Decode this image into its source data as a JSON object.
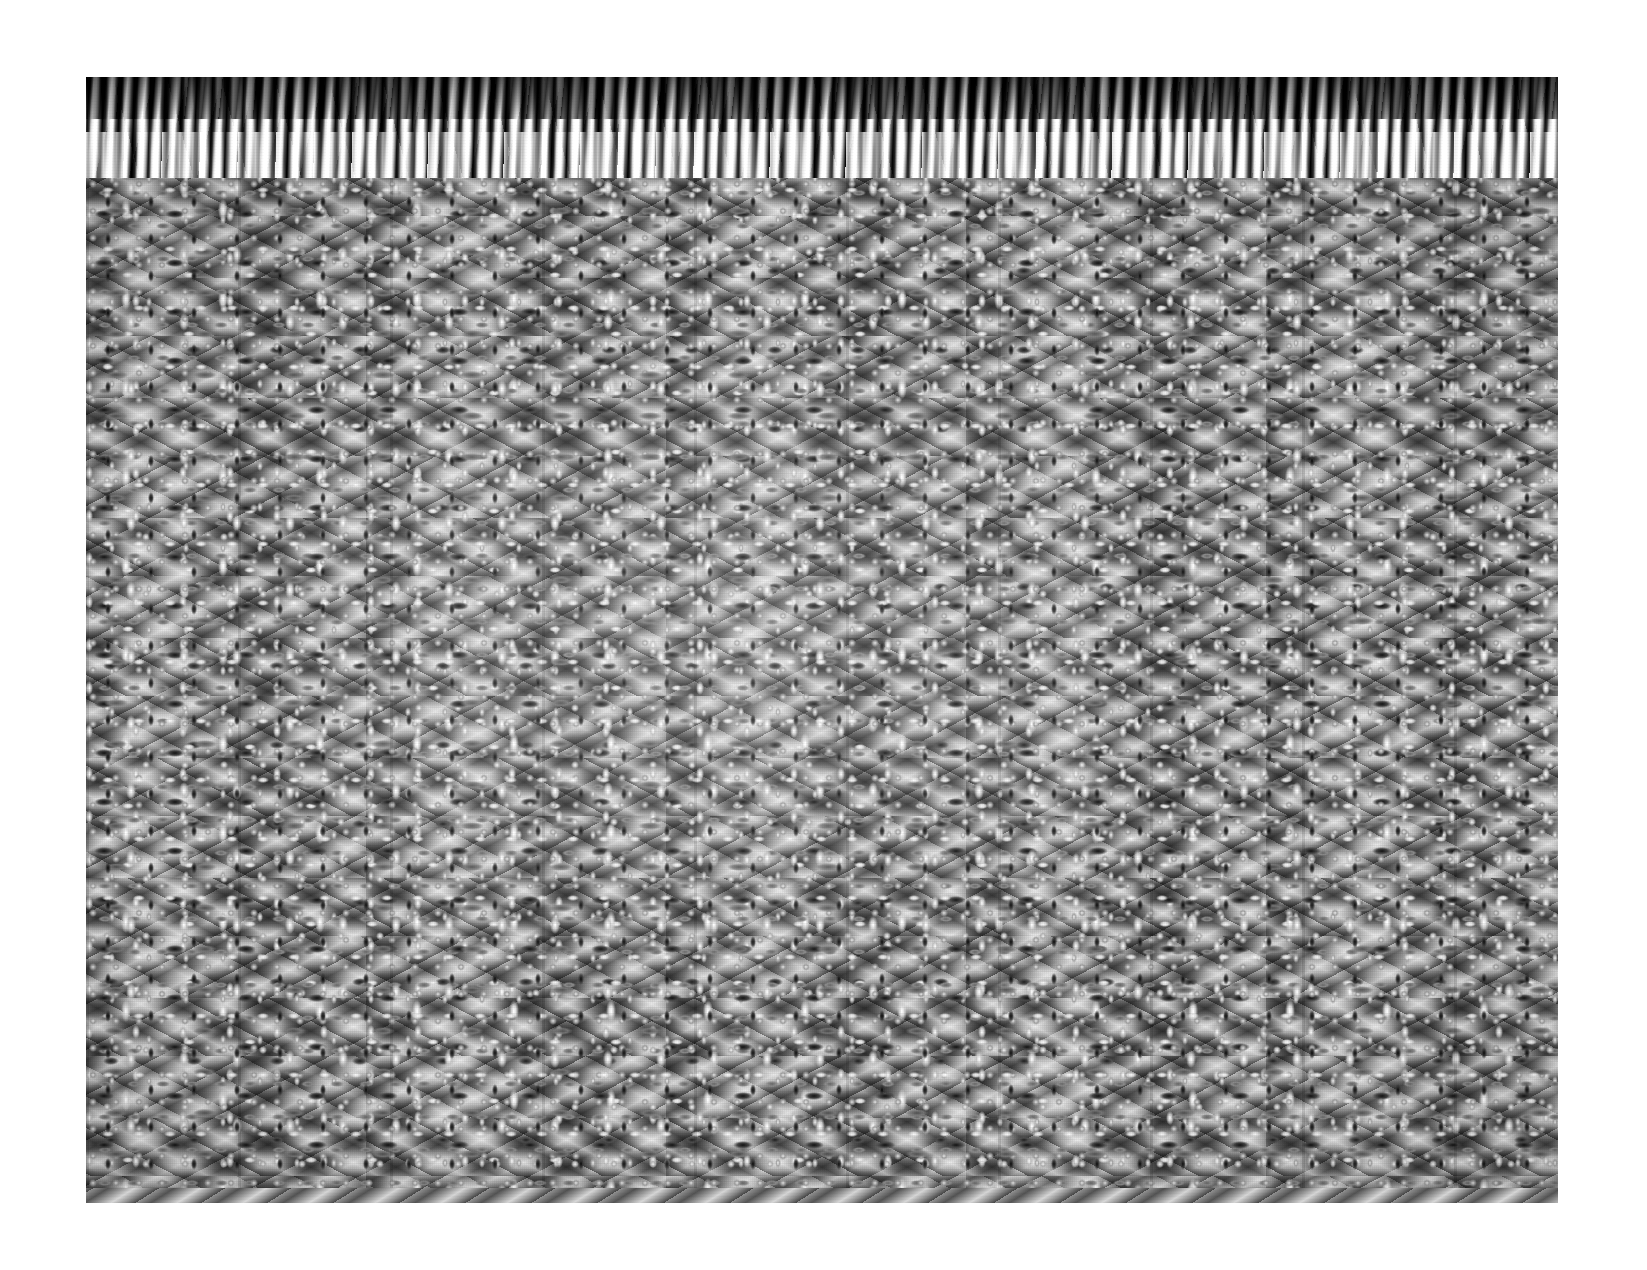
{
  "image": {
    "subject": "shag rug pile texture with fringe",
    "medium": "photograph",
    "color_mode": "grayscale",
    "orientation": "landscape",
    "canvas_width_px": 1647,
    "canvas_height_px": 1270,
    "border": {
      "style": "solid white margin",
      "color": "#ffffff",
      "left_px": 86,
      "top_px": 77,
      "right_px": 89,
      "bottom_px": 67
    },
    "plate": {
      "left_px": 86,
      "top_px": 77,
      "width_px": 1472,
      "height_px": 1126
    }
  },
  "regions": {
    "fringe_top": {
      "name": "top fringe",
      "description": "long wavy hanging tassel strands, high contrast black and white, splayed and swaying",
      "height_px": 101,
      "strand_width_px": 12,
      "sway": "wavy"
    },
    "pile_field": {
      "name": "main pile field",
      "description": "dense cut pile of short yarn tufts arranged in a chevron / zigzag herringbone pattern",
      "height_px": 1010,
      "pattern": "chevron zigzag",
      "chevron_band_height_px": 120,
      "chevron_wavelength_px": 300,
      "chevron_angle_deg": 28,
      "tuft_length_px": 14
    },
    "fringe_bottom": {
      "name": "bottom fringe",
      "description": "shorter straight vertical fringe strands below a knotted shoulder row",
      "height_px": 92,
      "strand_width_px": 10,
      "sway": "straight"
    }
  },
  "tones": {
    "paper_white": "#ffffff",
    "highlight": "#f4f4f4",
    "light_gray": "#cfcfcf",
    "mid_gray": "#8d8d8d",
    "dark_gray": "#4b4b4b",
    "shadow": "#1b1b1b",
    "black": "#0c0c0c"
  },
  "caption": ""
}
